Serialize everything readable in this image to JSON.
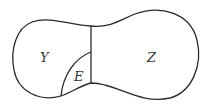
{
  "diagram": {
    "regions": [
      {
        "id": "Y",
        "label": "Y"
      },
      {
        "id": "E",
        "label": "E"
      },
      {
        "id": "Z",
        "label": "Z"
      }
    ],
    "colors": {
      "stroke": "#2a2a2a",
      "label": "#333333",
      "background": "#ffffff"
    }
  }
}
